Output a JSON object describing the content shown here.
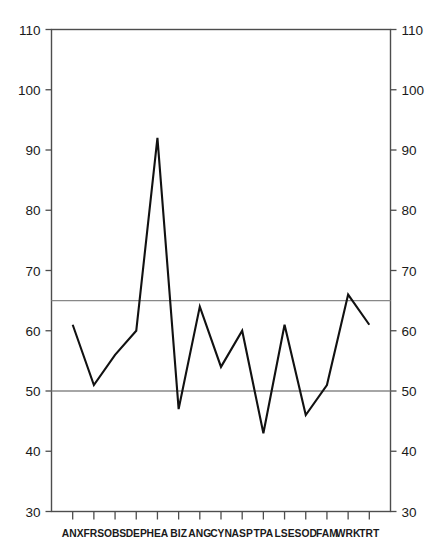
{
  "chart_data": {
    "type": "line",
    "title": "",
    "subtitle": "",
    "xlabel": "",
    "ylabel": "",
    "categories": [
      "ANX",
      "FRS",
      "OBS",
      "DEP",
      "HEA",
      "BIZ",
      "ANG",
      "CYN",
      "ASP",
      "TPA",
      "LSE",
      "SOD",
      "FAM",
      "WRK",
      "TRT"
    ],
    "values": [
      61,
      51,
      56,
      60,
      92,
      47,
      64,
      54,
      60,
      43,
      61,
      46,
      51,
      66,
      61
    ],
    "series": [
      {
        "name": "",
        "values": [
          61,
          51,
          56,
          60,
          92,
          47,
          64,
          54,
          60,
          43,
          61,
          46,
          51,
          66,
          61
        ]
      }
    ],
    "ylim": [
      30,
      110
    ],
    "ytick_values": [
      30,
      40,
      50,
      60,
      70,
      80,
      90,
      100,
      110
    ],
    "ytick_labels": [
      "30",
      "40",
      "50",
      "60",
      "70",
      "80",
      "90",
      "100",
      "110"
    ],
    "ytick_labels_right": [
      "30",
      "40",
      "50",
      "60",
      "70",
      "80",
      "90",
      "100",
      "110"
    ],
    "reference_lines": [
      {
        "value": 65,
        "label": "",
        "color": "#888888"
      },
      {
        "value": 50,
        "label": "",
        "color": "#888888"
      }
    ],
    "grid": false,
    "legend": null,
    "legend_position": "none",
    "annotations": [],
    "axis_colors": {
      "frame": "#4d4d4d",
      "reference": "#888888",
      "data_line": "#111111"
    },
    "dual_y_axis": true
  }
}
